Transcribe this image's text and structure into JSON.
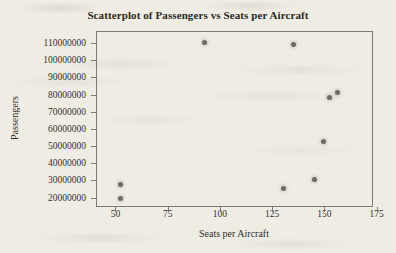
{
  "chart_data": {
    "type": "scatter",
    "title": "Scatterplot of Passengers vs Seats per Aircraft",
    "xlabel": "Seats per Aircraft",
    "ylabel": "Passengers",
    "xlim": [
      40.7,
      173.3
    ],
    "ylim": [
      14500000,
      117000000
    ],
    "grid": false,
    "legend": null,
    "xticks": [
      50,
      75,
      100,
      125,
      150,
      175
    ],
    "xtick_labels": [
      "50",
      "75",
      "100",
      "125",
      "150",
      "175"
    ],
    "yticks": [
      20000000,
      30000000,
      40000000,
      50000000,
      60000000,
      70000000,
      80000000,
      90000000,
      100000000,
      110000000
    ],
    "ytick_labels": [
      "20000000",
      "30000000",
      "40000000",
      "50000000",
      "60000000",
      "70000000",
      "80000000",
      "90000000",
      "100000000",
      "110000000"
    ],
    "marker": "filled-circle",
    "marker_color": "#6e6b66",
    "points": [
      {
        "x": 52,
        "y": 28000000
      },
      {
        "x": 52,
        "y": 20000000
      },
      {
        "x": 92,
        "y": 111000000
      },
      {
        "x": 130,
        "y": 26000000
      },
      {
        "x": 135,
        "y": 110000000
      },
      {
        "x": 145,
        "y": 31000000
      },
      {
        "x": 149,
        "y": 53000000
      },
      {
        "x": 152,
        "y": 79000000
      },
      {
        "x": 156,
        "y": 82000000
      }
    ]
  }
}
